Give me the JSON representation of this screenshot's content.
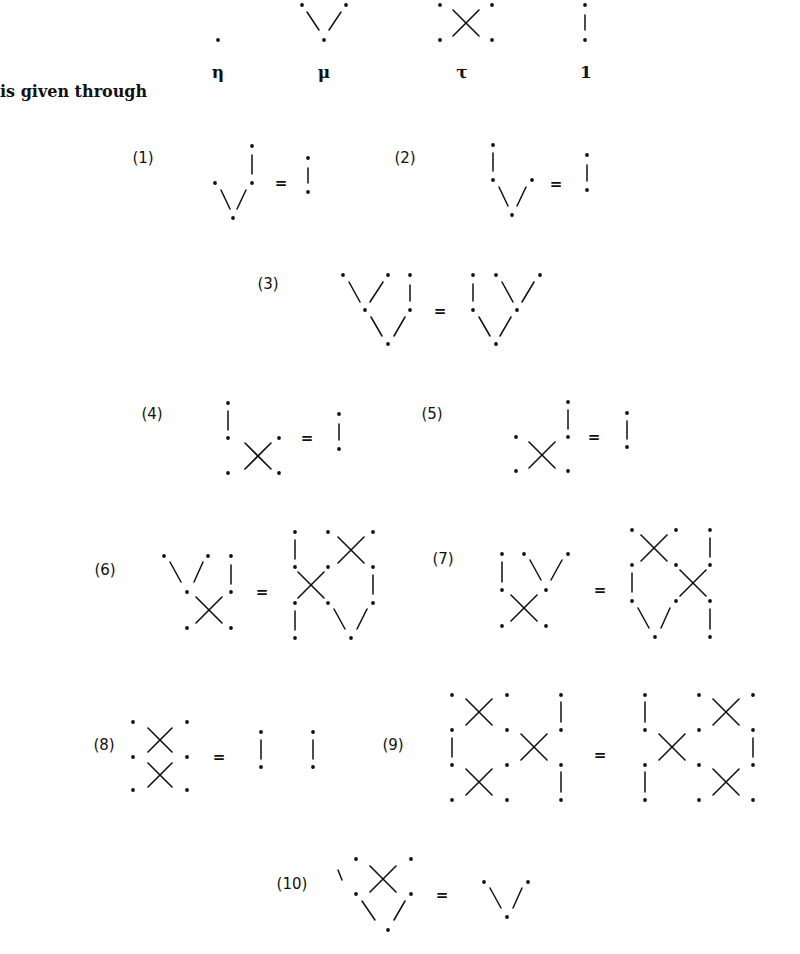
{
  "intro_text": "is given through",
  "generators": [
    {
      "name": "eta",
      "label": "η",
      "label_pos": [
        218,
        72
      ]
    },
    {
      "name": "mu",
      "label": "μ",
      "label_pos": [
        324,
        72
      ]
    },
    {
      "name": "tau",
      "label": "τ",
      "label_pos": [
        462,
        72
      ]
    },
    {
      "name": "identity",
      "label": "1",
      "label_pos": [
        586,
        72
      ]
    }
  ],
  "equations": [
    {
      "id": "eq1",
      "label": "(1)",
      "label_pos": [
        143,
        158
      ]
    },
    {
      "id": "eq2",
      "label": "(2)",
      "label_pos": [
        405,
        158
      ]
    },
    {
      "id": "eq3",
      "label": "(3)",
      "label_pos": [
        268,
        284
      ]
    },
    {
      "id": "eq4",
      "label": "(4)",
      "label_pos": [
        152,
        414
      ]
    },
    {
      "id": "eq5",
      "label": "(5)",
      "label_pos": [
        432,
        414
      ]
    },
    {
      "id": "eq6",
      "label": "(6)",
      "label_pos": [
        105,
        570
      ]
    },
    {
      "id": "eq7",
      "label": "(7)",
      "label_pos": [
        443,
        559
      ]
    },
    {
      "id": "eq8",
      "label": "(8)",
      "label_pos": [
        104,
        745
      ]
    },
    {
      "id": "eq9",
      "label": "(9)",
      "label_pos": [
        393,
        745
      ]
    },
    {
      "id": "eq10",
      "label": "(10)",
      "label_pos": [
        292,
        884
      ]
    }
  ],
  "equals_sign": "=",
  "equals_positions": [
    [
      281,
      183
    ],
    [
      556,
      184
    ],
    [
      440,
      311
    ],
    [
      307,
      438
    ],
    [
      594,
      437
    ],
    [
      262,
      592
    ],
    [
      600,
      590
    ],
    [
      219,
      757
    ],
    [
      600,
      755
    ],
    [
      442,
      895
    ]
  ],
  "geometry": {
    "dots": [
      [
        218,
        40
      ],
      [
        302,
        5
      ],
      [
        346,
        5
      ],
      [
        324,
        40
      ],
      [
        440,
        5
      ],
      [
        492,
        5
      ],
      [
        440,
        40
      ],
      [
        492,
        40
      ],
      [
        585,
        5
      ],
      [
        585,
        40
      ],
      [
        215,
        183
      ],
      [
        252,
        146
      ],
      [
        252,
        183
      ],
      [
        233,
        218
      ],
      [
        308,
        158
      ],
      [
        308,
        192
      ],
      [
        493,
        145
      ],
      [
        493,
        180
      ],
      [
        532,
        180
      ],
      [
        512,
        215
      ],
      [
        587,
        155
      ],
      [
        587,
        190
      ],
      [
        343,
        275
      ],
      [
        388,
        275
      ],
      [
        410,
        275
      ],
      [
        365,
        310
      ],
      [
        410,
        310
      ],
      [
        388,
        344
      ],
      [
        473,
        275
      ],
      [
        496,
        275
      ],
      [
        540,
        275
      ],
      [
        473,
        310
      ],
      [
        517,
        310
      ],
      [
        496,
        344
      ],
      [
        228,
        403
      ],
      [
        228,
        438
      ],
      [
        228,
        473
      ],
      [
        279,
        438
      ],
      [
        279,
        473
      ],
      [
        339,
        414
      ],
      [
        339,
        449
      ],
      [
        516,
        437
      ],
      [
        516,
        471
      ],
      [
        568,
        402
      ],
      [
        568,
        437
      ],
      [
        568,
        471
      ],
      [
        627,
        413
      ],
      [
        627,
        447
      ],
      [
        164,
        556
      ],
      [
        208,
        556
      ],
      [
        231,
        556
      ],
      [
        187,
        592
      ],
      [
        231,
        592
      ],
      [
        187,
        628
      ],
      [
        231,
        628
      ],
      [
        295,
        532
      ],
      [
        328,
        532
      ],
      [
        373,
        532
      ],
      [
        295,
        567
      ],
      [
        328,
        567
      ],
      [
        373,
        567
      ],
      [
        295,
        603
      ],
      [
        328,
        603
      ],
      [
        373,
        603
      ],
      [
        295,
        638
      ],
      [
        351,
        638
      ],
      [
        502,
        554
      ],
      [
        524,
        554
      ],
      [
        568,
        554
      ],
      [
        502,
        590
      ],
      [
        546,
        590
      ],
      [
        502,
        626
      ],
      [
        546,
        626
      ],
      [
        632,
        530
      ],
      [
        676,
        530
      ],
      [
        710,
        530
      ],
      [
        632,
        565
      ],
      [
        676,
        565
      ],
      [
        710,
        565
      ],
      [
        632,
        601
      ],
      [
        676,
        601
      ],
      [
        710,
        601
      ],
      [
        655,
        637
      ],
      [
        710,
        637
      ],
      [
        133,
        722
      ],
      [
        187,
        722
      ],
      [
        133,
        757
      ],
      [
        187,
        757
      ],
      [
        133,
        790
      ],
      [
        187,
        790
      ],
      [
        261,
        732
      ],
      [
        261,
        767
      ],
      [
        313,
        732
      ],
      [
        313,
        767
      ],
      [
        452,
        695
      ],
      [
        507,
        695
      ],
      [
        561,
        695
      ],
      [
        452,
        730
      ],
      [
        507,
        730
      ],
      [
        561,
        730
      ],
      [
        452,
        765
      ],
      [
        507,
        765
      ],
      [
        561,
        765
      ],
      [
        452,
        800
      ],
      [
        507,
        800
      ],
      [
        561,
        800
      ],
      [
        645,
        695
      ],
      [
        699,
        695
      ],
      [
        753,
        695
      ],
      [
        645,
        730
      ],
      [
        699,
        730
      ],
      [
        753,
        730
      ],
      [
        645,
        765
      ],
      [
        699,
        765
      ],
      [
        753,
        765
      ],
      [
        645,
        800
      ],
      [
        699,
        800
      ],
      [
        753,
        800
      ],
      [
        356,
        859
      ],
      [
        411,
        859
      ],
      [
        356,
        894
      ],
      [
        411,
        894
      ],
      [
        388,
        930
      ],
      [
        484,
        882
      ],
      [
        528,
        882
      ],
      [
        507,
        917
      ]
    ],
    "segments": [
      [
        307,
        12,
        319,
        30
      ],
      [
        341,
        12,
        329,
        30
      ],
      [
        585,
        15,
        585,
        30
      ],
      [
        221,
        190,
        230,
        209
      ],
      [
        246,
        190,
        237,
        209
      ],
      [
        252,
        155,
        252,
        174
      ],
      [
        308,
        168,
        308,
        183
      ],
      [
        499,
        187,
        508,
        206
      ],
      [
        526,
        187,
        517,
        206
      ],
      [
        493,
        153,
        493,
        171
      ],
      [
        587,
        165,
        587,
        181
      ],
      [
        349,
        282,
        360,
        302
      ],
      [
        383,
        282,
        370,
        302
      ],
      [
        410,
        285,
        410,
        301
      ],
      [
        371,
        317,
        382,
        336
      ],
      [
        405,
        317,
        394,
        336
      ],
      [
        473,
        284,
        473,
        301
      ],
      [
        502,
        282,
        513,
        302
      ],
      [
        534,
        282,
        522,
        302
      ],
      [
        479,
        317,
        490,
        336
      ],
      [
        511,
        317,
        500,
        336
      ],
      [
        228,
        411,
        228,
        430
      ],
      [
        339,
        424,
        339,
        440
      ],
      [
        568,
        410,
        568,
        429
      ],
      [
        627,
        421,
        627,
        439
      ],
      [
        170,
        562,
        181,
        582
      ],
      [
        203,
        562,
        194,
        582
      ],
      [
        231,
        565,
        231,
        584
      ],
      [
        295,
        540,
        295,
        559
      ],
      [
        373,
        575,
        373,
        594
      ],
      [
        295,
        611,
        295,
        630
      ],
      [
        334,
        609,
        345,
        629
      ],
      [
        367,
        609,
        357,
        629
      ],
      [
        502,
        562,
        502,
        582
      ],
      [
        530,
        560,
        541,
        580
      ],
      [
        562,
        560,
        551,
        580
      ],
      [
        710,
        538,
        710,
        557
      ],
      [
        632,
        573,
        632,
        592
      ],
      [
        638,
        608,
        649,
        628
      ],
      [
        670,
        608,
        661,
        628
      ],
      [
        710,
        609,
        710,
        629
      ],
      [
        261,
        740,
        261,
        759
      ],
      [
        313,
        740,
        313,
        759
      ],
      [
        452,
        738,
        452,
        757
      ],
      [
        561,
        702,
        561,
        722
      ],
      [
        561,
        772,
        561,
        792
      ],
      [
        645,
        702,
        645,
        722
      ],
      [
        753,
        738,
        753,
        757
      ],
      [
        645,
        772,
        645,
        792
      ],
      [
        338,
        870,
        342,
        880
      ],
      [
        362,
        901,
        375,
        920
      ],
      [
        405,
        901,
        394,
        920
      ],
      [
        490,
        888,
        501,
        908
      ],
      [
        522,
        888,
        513,
        908
      ]
    ],
    "crosses": [
      [
        466,
        23,
        13
      ],
      [
        258,
        456,
        13
      ],
      [
        542,
        455,
        13
      ],
      [
        209,
        610,
        13
      ],
      [
        351,
        550,
        13
      ],
      [
        311,
        585,
        13
      ],
      [
        524,
        608,
        13
      ],
      [
        654,
        548,
        13
      ],
      [
        693,
        583,
        13
      ],
      [
        160,
        740,
        12
      ],
      [
        160,
        775,
        12
      ],
      [
        479,
        712,
        13
      ],
      [
        534,
        747,
        13
      ],
      [
        479,
        782,
        13
      ],
      [
        726,
        712,
        13
      ],
      [
        672,
        747,
        13
      ],
      [
        726,
        782,
        13
      ],
      [
        383,
        879,
        13
      ]
    ]
  },
  "colors": {
    "ink": "#111111",
    "background": "#ffffff"
  }
}
